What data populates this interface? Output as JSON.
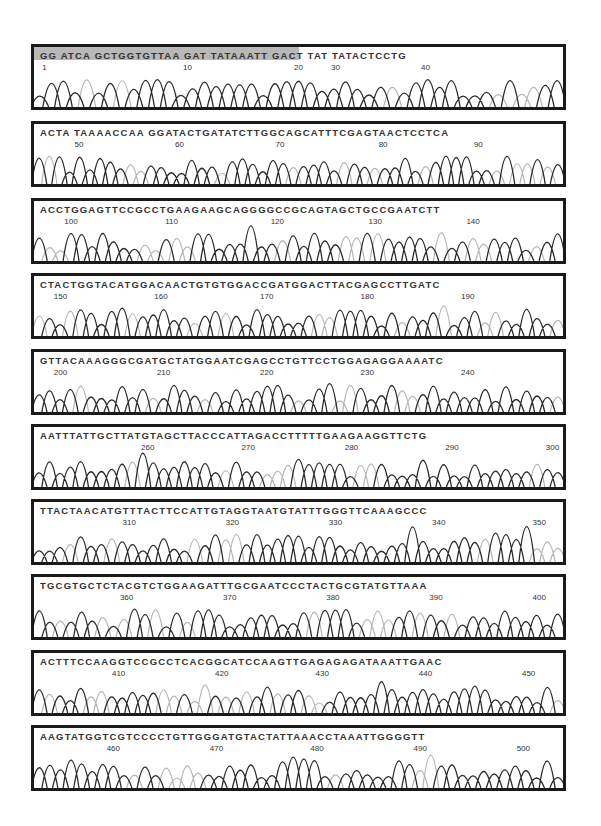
{
  "chart_data": {
    "type": "line",
    "xlabel": "Base position",
    "ylabel": "Fluorescence intensity",
    "xlim": [
      1,
      502
    ],
    "grid": false,
    "legend": "none",
    "series_note": "Four overlapping trace colors (rendered in grayscale: dark = one base channel, light gray = another)",
    "highlight_region": {
      "start": 1,
      "end": 20,
      "color": "#b8b8b8"
    },
    "rows": [
      {
        "sequence": "GG ATCA GCTGGTGTTAA GAT TATAAATT GACT TAT TATACTCCTG",
        "ticks": [
          1,
          10,
          20,
          30,
          40
        ],
        "tick_pos": [
          0.02,
          0.29,
          0.5,
          0.57,
          0.74
        ]
      },
      {
        "sequence": "ACTA TAAAACCAA GGATACTGATATCTTGGCAGCATTTCGAGTAACTCCTCA",
        "ticks": [
          50,
          60,
          70,
          80,
          90
        ],
        "tick_pos": [
          0.085,
          0.275,
          0.465,
          0.66,
          0.84
        ]
      },
      {
        "sequence": "ACCTGGAGTTCCGCCTGAAGAAGCAGGGGCCGCAGTAGCTGCCGAATCTT",
        "ticks": [
          100,
          110,
          120,
          130,
          140
        ],
        "tick_pos": [
          0.07,
          0.26,
          0.46,
          0.645,
          0.83
        ]
      },
      {
        "sequence": "CTACTGGTACATGGACAACTGTGTGGACCGATGGACTTACGAGCCTTGATC",
        "ticks": [
          150,
          160,
          170,
          180,
          190
        ],
        "tick_pos": [
          0.05,
          0.24,
          0.44,
          0.63,
          0.82
        ]
      },
      {
        "sequence": "GTTACAAAGGGCGATGCTATGGAATCGAGCCTGTTCCTGGAGAGGAAAATC",
        "ticks": [
          200,
          210,
          220,
          230,
          240
        ],
        "tick_pos": [
          0.05,
          0.245,
          0.44,
          0.63,
          0.82
        ]
      },
      {
        "sequence": "AATTTATTGCTTATGTAGCTTACCCATTAGACCTTTTTGAAGAAGGTTCTG",
        "ticks": [
          260,
          270,
          280,
          290,
          300
        ],
        "tick_pos": [
          0.215,
          0.405,
          0.6,
          0.79,
          0.98
        ]
      },
      {
        "sequence": "TTACTAACATGTTTACTTCCATTGTAGGTAATGTATTTGGGTTCAAAGCCC",
        "ticks": [
          310,
          320,
          330,
          340,
          350
        ],
        "tick_pos": [
          0.18,
          0.375,
          0.57,
          0.765,
          0.955
        ]
      },
      {
        "sequence": "TGCGTGCTCTACGTCTGGAAGATTTGCGAATCCCTACTGCGTATGTTAAA",
        "ticks": [
          360,
          370,
          380,
          390,
          400
        ],
        "tick_pos": [
          0.175,
          0.37,
          0.565,
          0.76,
          0.955
        ]
      },
      {
        "sequence": "ACTTTCCAAGGTCCGCCTCACGGCATCCAAGTTGAGAGAGATAAATTGAAC",
        "ticks": [
          410,
          420,
          430,
          440,
          450
        ],
        "tick_pos": [
          0.16,
          0.355,
          0.545,
          0.74,
          0.935
        ]
      },
      {
        "sequence": "AAGTATGGTCGTCCCCTGTTGGGATGTACTATTAAACCTAAATTGGGGTT",
        "ticks": [
          460,
          470,
          480,
          490,
          500
        ],
        "tick_pos": [
          0.15,
          0.345,
          0.535,
          0.73,
          0.925
        ]
      }
    ],
    "colors": {
      "dark": "#2a2a2a",
      "light": "#b5b5b5",
      "frame": "#1a1a1a",
      "highlight": "#b8b8b8"
    }
  }
}
